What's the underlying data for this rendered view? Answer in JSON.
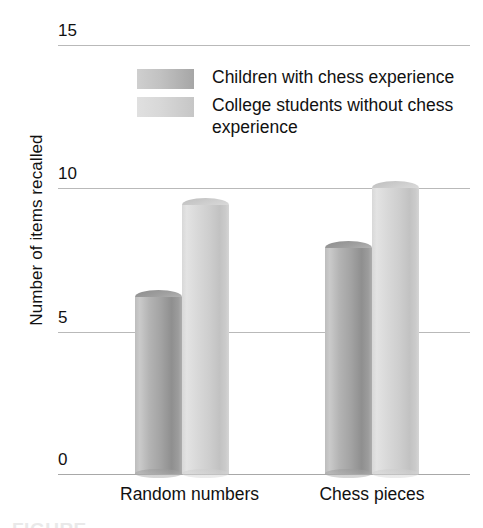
{
  "chart_data": {
    "type": "bar",
    "title": "",
    "xlabel": "",
    "ylabel": "Number of items recalled",
    "categories": [
      "Random numbers",
      "Chess pieces"
    ],
    "series": [
      {
        "name": "Children with chess experience",
        "values": [
          6.2,
          7.9
        ],
        "color": "#a3a3a3"
      },
      {
        "name": "College students without chess experience",
        "values": [
          9.4,
          10.0
        ],
        "color": "#d4d4d4"
      }
    ],
    "ylim": [
      0,
      15
    ],
    "yticks": [
      0,
      5,
      10,
      15
    ],
    "ytick_labels": [
      "0",
      "5",
      "10",
      "15"
    ],
    "grid": true,
    "legend_position": "top-center",
    "style": "3d-cylinder"
  },
  "axis": {
    "y_title": "Number of items recalled",
    "ticks": [
      {
        "label": "15",
        "value": 15
      },
      {
        "label": "10",
        "value": 10
      },
      {
        "label": "5",
        "value": 5
      },
      {
        "label": "0",
        "value": 0
      }
    ]
  },
  "legend": {
    "items": [
      {
        "label": "Children with chess experience",
        "swatch": "dark"
      },
      {
        "label": "College students without chess experience",
        "swatch": "light"
      }
    ]
  },
  "categories": [
    {
      "label": "Random numbers"
    },
    {
      "label": "Chess pieces"
    }
  ],
  "caption": {
    "clipped_text": "FIGURE"
  },
  "colors": {
    "series_dark": "#a3a3a3",
    "series_light": "#d4d4d4",
    "gridline": "#b9b9b9",
    "text": "#111111"
  }
}
